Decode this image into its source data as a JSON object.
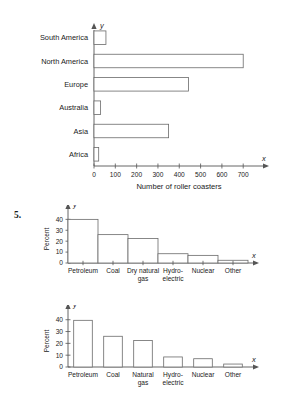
{
  "question_number": "5.",
  "chart_data": [
    {
      "id": "roller-coasters",
      "type": "bar",
      "orientation": "horizontal",
      "title": "",
      "xlabel": "Number of roller coasters",
      "ylabel": "",
      "x_axis_name": "x",
      "y_axis_name": "y",
      "categories": [
        "Africa",
        "Asia",
        "Australia",
        "Europe",
        "North America",
        "South America"
      ],
      "values": [
        22,
        350,
        31,
        443,
        700,
        56
      ],
      "xlim": [
        0,
        760
      ],
      "xticks": [
        0,
        100,
        200,
        300,
        400,
        500,
        600,
        700
      ],
      "xticklabels": [
        "0",
        "100",
        "200",
        "300",
        "400",
        "500",
        "600",
        "700"
      ],
      "grid": false,
      "legend": "none"
    },
    {
      "id": "energy-histogram",
      "type": "bar",
      "orientation": "vertical",
      "style": "histogram",
      "title": "",
      "xlabel": "",
      "ylabel": "Percent",
      "x_axis_name": "x",
      "y_axis_name": "y",
      "categories": [
        "Petroleum",
        "Coal",
        "Dry natural gas",
        "Hydro-electric",
        "Nuclear",
        "Other"
      ],
      "category_lines": [
        [
          "Petroleum"
        ],
        [
          "Coal"
        ],
        [
          "Dry natural",
          "gas"
        ],
        [
          "Hydro-",
          "electric"
        ],
        [
          "Nuclear"
        ],
        [
          "Other"
        ]
      ],
      "values": [
        40,
        26,
        22.5,
        8.5,
        7,
        2.5
      ],
      "ylim": [
        0,
        44
      ],
      "yticks": [
        0,
        10,
        20,
        30,
        40
      ],
      "yticklabels": [
        "0",
        "10",
        "20",
        "30",
        "40"
      ],
      "grid": false,
      "legend": "none"
    },
    {
      "id": "energy-barchart",
      "type": "bar",
      "orientation": "vertical",
      "style": "separated",
      "title": "",
      "xlabel": "",
      "ylabel": "Percent",
      "x_axis_name": "x",
      "y_axis_name": "y",
      "categories": [
        "Petroleum",
        "Coal",
        "Natural gas",
        "Hydro-electric",
        "Nuclear",
        "Other"
      ],
      "category_lines": [
        [
          "Petroleum"
        ],
        [
          "Coal"
        ],
        [
          "Natural",
          "gas"
        ],
        [
          "Hydro-",
          "electric"
        ],
        [
          "Nuclear"
        ],
        [
          "Other"
        ]
      ],
      "values": [
        39.5,
        26,
        22.5,
        8.5,
        7,
        2.5
      ],
      "ylim": [
        0,
        44
      ],
      "yticks": [
        0,
        10,
        20,
        30,
        40
      ],
      "yticklabels": [
        "0",
        "10",
        "20",
        "30",
        "40"
      ],
      "grid": false,
      "legend": "none"
    }
  ]
}
